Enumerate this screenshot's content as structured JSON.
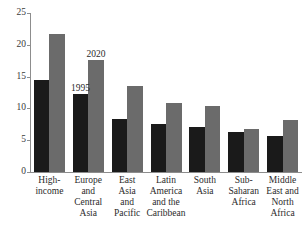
{
  "clipped_top_text": "· ·                    ·",
  "chart_data": {
    "type": "bar",
    "title": "",
    "subtitle": "",
    "xlabel": "",
    "ylabel": "",
    "ylim": [
      0,
      25
    ],
    "yticks": [
      0,
      5,
      10,
      15,
      20,
      25
    ],
    "ytick_labels": [
      "0",
      "5",
      "10",
      "15",
      "20",
      "25"
    ],
    "grid": false,
    "legend_position": "inline-annotation",
    "categories": [
      "High-\nincome",
      "Europe\nand\nCentral\nAsia",
      "East\nAsia\nand\nPacific",
      "Latin\nAmerica\nand the\nCaribbean",
      "South\nAsia",
      "Sub-\nSaharan\nAfrica",
      "Middle\nEast and\nNorth\nAfrica"
    ],
    "series": [
      {
        "name": "1995",
        "color": "#1a1a1a",
        "values": [
          14.5,
          12.2,
          8.4,
          7.6,
          7.0,
          6.3,
          5.7
        ]
      },
      {
        "name": "2020",
        "color": "#6b6b6b",
        "values": [
          21.7,
          17.6,
          13.6,
          10.8,
          10.4,
          6.7,
          8.2
        ]
      }
    ],
    "annotations": [
      {
        "text": "1995",
        "series": 0,
        "category_index": 1
      },
      {
        "text": "2020",
        "series": 1,
        "category_index": 1
      }
    ]
  }
}
